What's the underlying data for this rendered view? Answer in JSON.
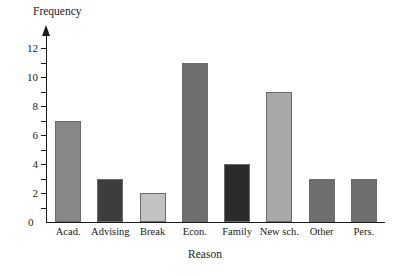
{
  "chart_data": {
    "type": "bar",
    "title": "",
    "xlabel": "Reason",
    "ylabel": "Frequency",
    "categories": [
      "Acad.",
      "Advising",
      "Break",
      "Econ.",
      "Family",
      "New sch.",
      "Other",
      "Pers."
    ],
    "values": [
      7,
      3,
      2,
      11,
      4,
      9,
      3,
      3
    ],
    "bar_colors": [
      "#878787",
      "#3d3d3d",
      "#c2c2c2",
      "#6e6e6e",
      "#2b2b2b",
      "#a8a8a8",
      "#6e6e6e",
      "#6e6e6e"
    ],
    "ylim": [
      0,
      12
    ],
    "y_tick_labels": [
      "2",
      "4",
      "6",
      "8",
      "10",
      "12"
    ],
    "y_tick_values": [
      2,
      4,
      6,
      8,
      10,
      12
    ],
    "y_minor_ticks": [
      1,
      3,
      5,
      7,
      9,
      11
    ],
    "origin_label": "0",
    "grid": false,
    "legend": null,
    "axis_color": "#1a1a1a",
    "bar_edge_color": "#6b6b6b"
  }
}
